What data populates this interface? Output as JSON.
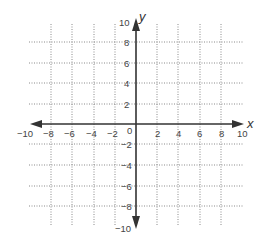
{
  "diagram": {
    "type": "coordinate-plane",
    "x_axis": {
      "label": "x",
      "min": -10,
      "max": 10,
      "step": 2,
      "tick_labels": [
        "−10",
        "−8",
        "−6",
        "−4",
        "−2",
        "0",
        "2",
        "4",
        "6",
        "8",
        "10"
      ]
    },
    "y_axis": {
      "label": "y",
      "min": -10,
      "max": 10,
      "step": 2,
      "tick_labels_positive": [
        "10",
        "8",
        "6",
        "4",
        "2"
      ],
      "tick_labels_negative": [
        "−2",
        "−4",
        "−6",
        "−8",
        "−10"
      ]
    },
    "grid": "dotted",
    "colors": {
      "axis": "#333333",
      "grid": "#8a8a8a",
      "text": "#444444"
    }
  }
}
